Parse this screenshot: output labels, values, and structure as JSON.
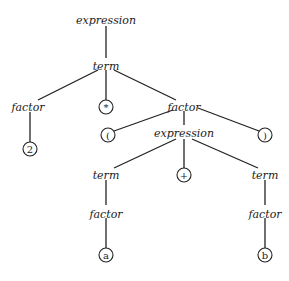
{
  "diagram": {
    "type": "parse-tree",
    "nodes": {
      "n0": {
        "label": "expression",
        "kind": "nonterminal",
        "x": 106,
        "y": 20
      },
      "n1": {
        "label": "term",
        "kind": "nonterminal",
        "x": 106,
        "y": 66
      },
      "n2": {
        "label": "factor",
        "kind": "nonterminal",
        "x": 28,
        "y": 107
      },
      "n3": {
        "label": "*",
        "kind": "terminal",
        "x": 106,
        "y": 107
      },
      "n4": {
        "label": "factor",
        "kind": "nonterminal",
        "x": 184,
        "y": 107
      },
      "n5": {
        "label": "2",
        "kind": "terminal",
        "x": 30,
        "y": 149
      },
      "n6": {
        "label": "(",
        "kind": "terminal",
        "x": 108,
        "y": 135
      },
      "n7": {
        "label": "expression",
        "kind": "nonterminal",
        "x": 184,
        "y": 134
      },
      "n8": {
        "label": ")",
        "kind": "terminal",
        "x": 265,
        "y": 135
      },
      "n9": {
        "label": "term",
        "kind": "nonterminal",
        "x": 106,
        "y": 175
      },
      "n10": {
        "label": "+",
        "kind": "terminal",
        "x": 184,
        "y": 175
      },
      "n11": {
        "label": "term",
        "kind": "nonterminal",
        "x": 265,
        "y": 175
      },
      "n12": {
        "label": "factor",
        "kind": "nonterminal",
        "x": 106,
        "y": 214
      },
      "n13": {
        "label": "factor",
        "kind": "nonterminal",
        "x": 265,
        "y": 214
      },
      "n14": {
        "label": "a",
        "kind": "terminal",
        "x": 106,
        "y": 255
      },
      "n15": {
        "label": "b",
        "kind": "terminal",
        "x": 265,
        "y": 255
      }
    }
  }
}
